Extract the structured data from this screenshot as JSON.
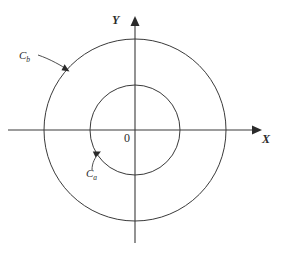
{
  "figure": {
    "background_color": "#ffffff",
    "stroke_color": "#3a3a3a",
    "axes": {
      "x_label": "X",
      "y_label": "Y",
      "origin_label": "0",
      "x_axis": {
        "x1": 8,
        "y1": 130,
        "x2": 256,
        "y2": 130,
        "arrow": "right"
      },
      "y_axis": {
        "x1": 135,
        "y1": 243,
        "x2": 135,
        "y2": 22,
        "arrow": "up"
      }
    },
    "circles": [
      {
        "name": "inner-circle",
        "label": "C",
        "subscript": "a",
        "cx": 135,
        "cy": 130,
        "r": 45,
        "leader": {
          "path": "M 100 152 C 94 160, 92 164, 92 168",
          "arrow_at": {
            "x": 100,
            "y": 152
          }
        }
      },
      {
        "name": "outer-circle",
        "label": "C",
        "subscript": "b",
        "cx": 135,
        "cy": 130,
        "r": 91,
        "leader": {
          "path": "M 70 71 C 62 66, 50 59, 38 55",
          "arrow_at": {
            "x": 70,
            "y": 71
          }
        }
      }
    ]
  }
}
